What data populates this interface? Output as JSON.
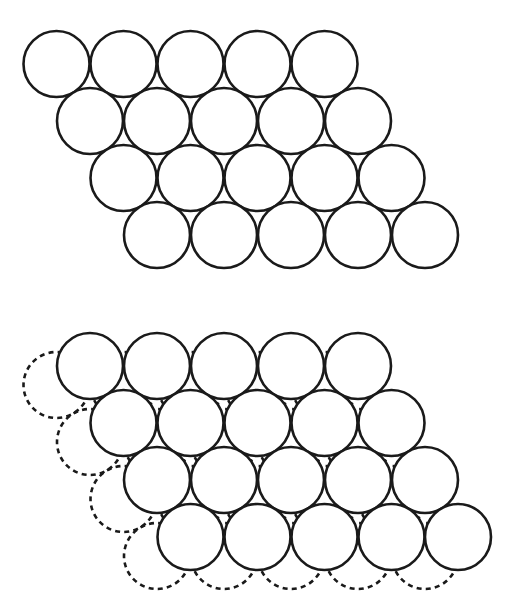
{
  "figure": {
    "background_color": "#ffffff",
    "line_color": "#1a1a1a",
    "canvas": {
      "width": 511,
      "height": 613
    }
  },
  "geometry": {
    "radius": 33,
    "stroke_width": 2.6,
    "dash_pattern": "5 4.2",
    "row_x_step": 67,
    "row_y_step": 57,
    "row_x_stagger": 33.5,
    "second_layer_offset": {
      "dx": -33.5,
      "dy": 19.0
    }
  },
  "panels": [
    {
      "id": "panel-layer-a",
      "name": "single-close-packed-layer",
      "label": "",
      "origin": {
        "x": 56.5,
        "y": 64
      },
      "rows": [
        {
          "index": 0,
          "count": 5,
          "start_x": 56.5,
          "y": 64
        },
        {
          "index": 1,
          "count": 5,
          "start_x": 90.0,
          "y": 121
        },
        {
          "index": 2,
          "count": 5,
          "start_x": 123.5,
          "y": 178
        },
        {
          "index": 3,
          "count": 5,
          "start_x": 157.0,
          "y": 235
        }
      ],
      "solid_circles": [
        {
          "cx": 56.5,
          "cy": 64
        },
        {
          "cx": 123.5,
          "cy": 64
        },
        {
          "cx": 190.5,
          "cy": 64
        },
        {
          "cx": 257.5,
          "cy": 64
        },
        {
          "cx": 324.5,
          "cy": 64
        },
        {
          "cx": 90.0,
          "cy": 121
        },
        {
          "cx": 157.0,
          "cy": 121
        },
        {
          "cx": 224.0,
          "cy": 121
        },
        {
          "cx": 291.0,
          "cy": 121
        },
        {
          "cx": 358.0,
          "cy": 121
        },
        {
          "cx": 123.5,
          "cy": 178
        },
        {
          "cx": 190.5,
          "cy": 178
        },
        {
          "cx": 257.5,
          "cy": 178
        },
        {
          "cx": 324.5,
          "cy": 178
        },
        {
          "cx": 391.5,
          "cy": 178
        },
        {
          "cx": 157.0,
          "cy": 235
        },
        {
          "cx": 224.0,
          "cy": 235
        },
        {
          "cx": 291.0,
          "cy": 235
        },
        {
          "cx": 358.0,
          "cy": 235
        },
        {
          "cx": 425.0,
          "cy": 235
        }
      ],
      "dashed_circles": []
    },
    {
      "id": "panel-layer-ab",
      "name": "two-close-packed-layers",
      "label": "",
      "origin": {
        "x": 90.0,
        "y": 366
      },
      "rows": [
        {
          "index": 0,
          "count": 5,
          "start_x": 90.0,
          "y": 366
        },
        {
          "index": 1,
          "count": 5,
          "start_x": 123.5,
          "y": 423
        },
        {
          "index": 2,
          "count": 5,
          "start_x": 157.0,
          "y": 480
        },
        {
          "index": 3,
          "count": 5,
          "start_x": 190.5,
          "y": 537
        }
      ],
      "solid_circles": [
        {
          "cx": 90.0,
          "cy": 366
        },
        {
          "cx": 157.0,
          "cy": 366
        },
        {
          "cx": 224.0,
          "cy": 366
        },
        {
          "cx": 291.0,
          "cy": 366
        },
        {
          "cx": 358.0,
          "cy": 366
        },
        {
          "cx": 123.5,
          "cy": 423
        },
        {
          "cx": 190.5,
          "cy": 423
        },
        {
          "cx": 257.5,
          "cy": 423
        },
        {
          "cx": 324.5,
          "cy": 423
        },
        {
          "cx": 391.5,
          "cy": 423
        },
        {
          "cx": 157.0,
          "cy": 480
        },
        {
          "cx": 224.0,
          "cy": 480
        },
        {
          "cx": 291.0,
          "cy": 480
        },
        {
          "cx": 358.0,
          "cy": 480
        },
        {
          "cx": 425.0,
          "cy": 480
        },
        {
          "cx": 190.5,
          "cy": 537
        },
        {
          "cx": 257.5,
          "cy": 537
        },
        {
          "cx": 324.5,
          "cy": 537
        },
        {
          "cx": 391.5,
          "cy": 537
        },
        {
          "cx": 458.0,
          "cy": 537
        }
      ],
      "dashed_circles": [
        {
          "cx": 56.5,
          "cy": 385
        },
        {
          "cx": 123.5,
          "cy": 385
        },
        {
          "cx": 190.5,
          "cy": 385
        },
        {
          "cx": 257.5,
          "cy": 385
        },
        {
          "cx": 324.5,
          "cy": 385
        },
        {
          "cx": 90.0,
          "cy": 442
        },
        {
          "cx": 157.0,
          "cy": 442
        },
        {
          "cx": 224.0,
          "cy": 442
        },
        {
          "cx": 291.0,
          "cy": 442
        },
        {
          "cx": 358.0,
          "cy": 442
        },
        {
          "cx": 123.5,
          "cy": 499
        },
        {
          "cx": 190.5,
          "cy": 499
        },
        {
          "cx": 257.5,
          "cy": 499
        },
        {
          "cx": 324.5,
          "cy": 499
        },
        {
          "cx": 391.5,
          "cy": 499
        },
        {
          "cx": 157.0,
          "cy": 556
        },
        {
          "cx": 224.0,
          "cy": 556
        },
        {
          "cx": 291.0,
          "cy": 556
        },
        {
          "cx": 358.0,
          "cy": 556
        },
        {
          "cx": 425.0,
          "cy": 556
        }
      ]
    }
  ]
}
